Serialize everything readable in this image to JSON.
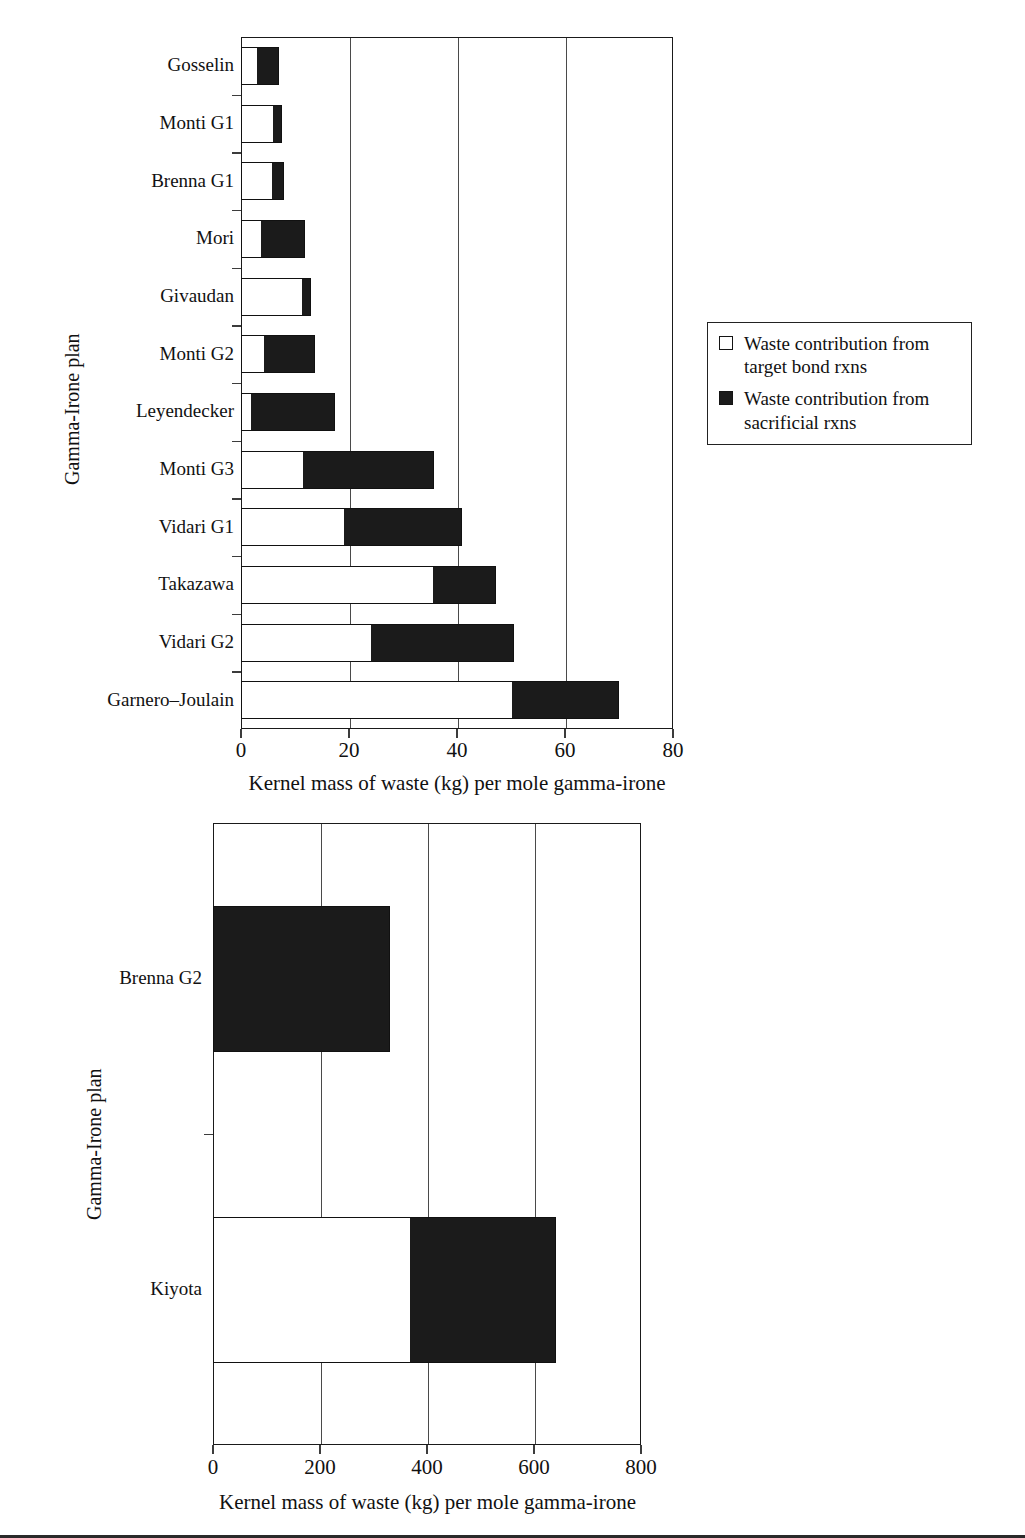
{
  "legend": {
    "entries": [
      {
        "swatch": "hollow-square-icon",
        "label": "Waste contribution from target bond rxns"
      },
      {
        "swatch": "filled-square-icon",
        "label": "Waste contribution from sacrificial rxns"
      }
    ]
  },
  "colors": {
    "target_bond": "#ffffff",
    "sacrificial": "#1b1b1b",
    "outline": "#111111",
    "gridline": "#4a4a4a"
  },
  "chart_data": [
    {
      "id": "chart-upper",
      "type": "bar",
      "orientation": "horizontal",
      "stacked": true,
      "title": "",
      "xlabel": "Kernel mass of waste (kg) per mole gamma-irone",
      "ylabel": "Gamma-Irone plan",
      "xlim": [
        0,
        80
      ],
      "xticks": [
        0,
        20,
        40,
        60,
        80
      ],
      "xticklabels": [
        "0",
        "20",
        "40",
        "60",
        "80"
      ],
      "grid": "vertical",
      "legend_position": "right",
      "categories": [
        "Gosselin",
        "Monti G1",
        "Brenna G1",
        "Mori",
        "Givaudan",
        "Monti G2",
        "Leyendecker",
        "Monti G3",
        "Vidari G1",
        "Takazawa",
        "Vidari G2",
        "Garnero–Joulain"
      ],
      "series": [
        {
          "name": "Waste contribution from target bond rxns",
          "values": [
            3.0,
            5.9,
            5.7,
            3.7,
            11.3,
            4.2,
            1.8,
            11.5,
            19.1,
            35.6,
            24.1,
            50.1
          ]
        },
        {
          "name": "Waste contribution from sacrificial rxns",
          "values": [
            4.1,
            1.7,
            2.3,
            8.1,
            1.7,
            9.5,
            15.7,
            24.2,
            21.9,
            11.6,
            26.4,
            19.9
          ]
        }
      ],
      "totals": [
        7.1,
        7.6,
        8.0,
        11.8,
        13.0,
        13.7,
        17.5,
        35.7,
        41.0,
        47.2,
        50.5,
        70.0
      ]
    },
    {
      "id": "chart-lower",
      "type": "bar",
      "orientation": "horizontal",
      "stacked": true,
      "title": "",
      "xlabel": "Kernel mass of waste (kg) per mole gamma-irone",
      "ylabel": "Gamma-Irone plan",
      "xlim": [
        0,
        800
      ],
      "xticks": [
        0,
        200,
        400,
        600,
        800
      ],
      "xticklabels": [
        "0",
        "200",
        "400",
        "600",
        "800"
      ],
      "grid": "vertical",
      "legend_position": "right",
      "categories": [
        "Brenna G2",
        "Kiyota"
      ],
      "series": [
        {
          "name": "Waste contribution from target bond rxns",
          "values": [
            0,
            368
          ]
        },
        {
          "name": "Waste contribution from sacrificial rxns",
          "values": [
            331,
            274
          ]
        }
      ],
      "totals": [
        331,
        642
      ]
    }
  ]
}
